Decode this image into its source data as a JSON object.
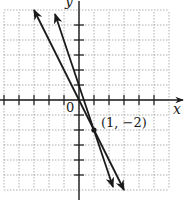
{
  "chart_data": {
    "type": "line",
    "title": "",
    "xlabel": "x",
    "ylabel": "y",
    "xlim": [
      -5,
      6
    ],
    "ylim": [
      -6,
      6
    ],
    "grid": true,
    "origin_label": "0",
    "series": [
      {
        "name": "line 1",
        "equation": "y = -2x",
        "slope": -2,
        "intercept": 0,
        "points": [
          [
            -3,
            6
          ],
          [
            3,
            -6
          ]
        ]
      },
      {
        "name": "line 2",
        "equation": "y = -3x + 1",
        "slope": -3,
        "intercept": 1,
        "points": [
          [
            -1.6,
            5.8
          ],
          [
            2.27,
            -5.8
          ]
        ]
      }
    ],
    "annotations": [
      {
        "text": "(1, −2)",
        "x": 1,
        "y": -2,
        "type": "intersection-point"
      }
    ]
  },
  "labels": {
    "x_axis": "x",
    "y_axis": "y",
    "origin": "0",
    "point": "(1, −2)"
  }
}
